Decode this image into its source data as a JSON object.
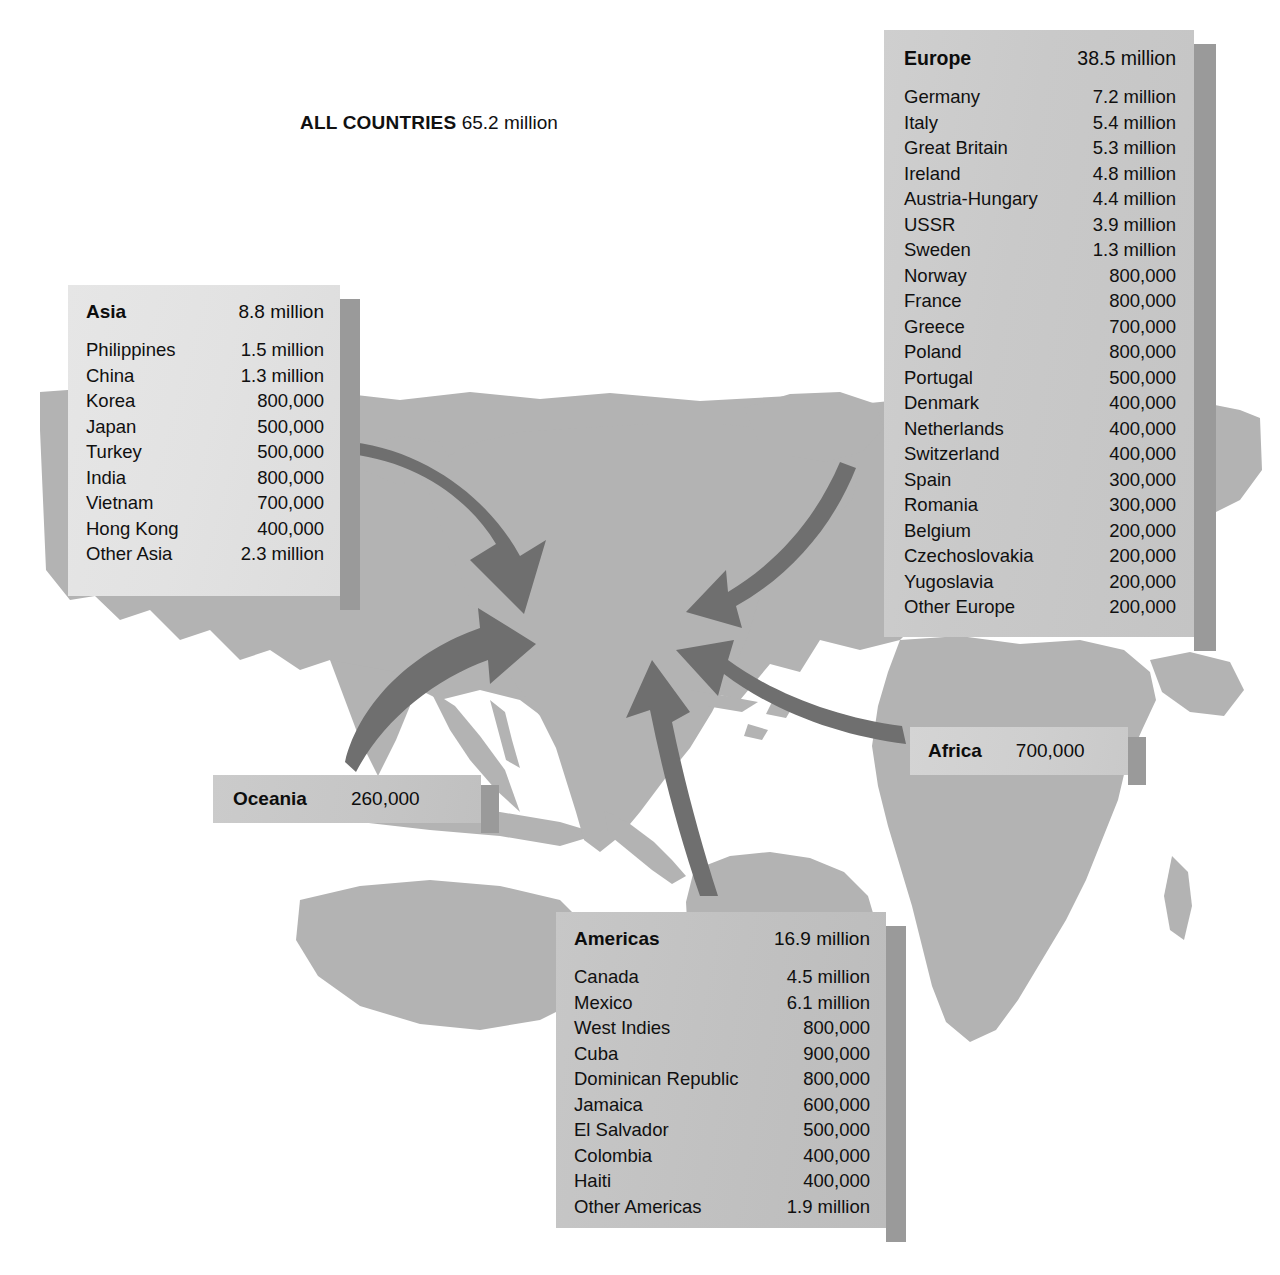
{
  "title": {
    "label": "ALL COUNTRIES",
    "value": "65.2 million"
  },
  "panels": {
    "europe": {
      "name": "Europe",
      "total": "38.5 million",
      "rows": [
        {
          "country": "Germany",
          "value": "7.2 million"
        },
        {
          "country": "Italy",
          "value": "5.4 million"
        },
        {
          "country": "Great Britain",
          "value": "5.3 million"
        },
        {
          "country": "Ireland",
          "value": "4.8 million"
        },
        {
          "country": "Austria-Hungary",
          "value": "4.4 million"
        },
        {
          "country": "USSR",
          "value": "3.9 million"
        },
        {
          "country": "Sweden",
          "value": "1.3 million"
        },
        {
          "country": "Norway",
          "value": "800,000"
        },
        {
          "country": "France",
          "value": "800,000"
        },
        {
          "country": "Greece",
          "value": "700,000"
        },
        {
          "country": "Poland",
          "value": "800,000"
        },
        {
          "country": "Portugal",
          "value": "500,000"
        },
        {
          "country": "Denmark",
          "value": "400,000"
        },
        {
          "country": "Netherlands",
          "value": "400,000"
        },
        {
          "country": "Switzerland",
          "value": "400,000"
        },
        {
          "country": "Spain",
          "value": "300,000"
        },
        {
          "country": "Romania",
          "value": "300,000"
        },
        {
          "country": "Belgium",
          "value": "200,000"
        },
        {
          "country": "Czechoslovakia",
          "value": "200,000"
        },
        {
          "country": "Yugoslavia",
          "value": "200,000"
        },
        {
          "country": "Other Europe",
          "value": "200,000"
        }
      ]
    },
    "asia": {
      "name": "Asia",
      "total": "8.8 million",
      "rows": [
        {
          "country": "Philippines",
          "value": "1.5 million"
        },
        {
          "country": "China",
          "value": "1.3 million"
        },
        {
          "country": "Korea",
          "value": "800,000"
        },
        {
          "country": "Japan",
          "value": "500,000"
        },
        {
          "country": "Turkey",
          "value": "500,000"
        },
        {
          "country": "India",
          "value": "800,000"
        },
        {
          "country": "Vietnam",
          "value": "700,000"
        },
        {
          "country": "Hong Kong",
          "value": "400,000"
        },
        {
          "country": "Other Asia",
          "value": "2.3 million"
        }
      ]
    },
    "americas": {
      "name": "Americas",
      "total": "16.9 million",
      "rows": [
        {
          "country": "Canada",
          "value": "4.5 million"
        },
        {
          "country": "Mexico",
          "value": "6.1 million"
        },
        {
          "country": "West Indies",
          "value": "800,000"
        },
        {
          "country": "Cuba",
          "value": "900,000"
        },
        {
          "country": "Dominican Republic",
          "value": "800,000"
        },
        {
          "country": "Jamaica",
          "value": "600,000"
        },
        {
          "country": "El Salvador",
          "value": "500,000"
        },
        {
          "country": "Colombia",
          "value": "400,000"
        },
        {
          "country": "Haiti",
          "value": "400,000"
        },
        {
          "country": "Other Americas",
          "value": "1.9 million"
        }
      ]
    },
    "oceania": {
      "name": "Oceania",
      "total": "260,000",
      "rows": []
    },
    "africa": {
      "name": "Africa",
      "total": "700,000",
      "rows": []
    }
  },
  "colors": {
    "land": "#b3b3b3",
    "arrow": "#6f6f6f",
    "panel_light": "#e2e2e2",
    "panel_mid": "#cbcbcb",
    "panel_dark": "#c1c1c1",
    "shadow": "#9a9a9a",
    "background": "#ffffff",
    "text": "#101010"
  },
  "chart_data": {
    "type": "table",
    "title": "ALL COUNTRIES 65.2 million",
    "regions": [
      {
        "name": "Europe",
        "total_text": "38.5 million",
        "total_millions": 38.5
      },
      {
        "name": "Americas",
        "total_text": "16.9 million",
        "total_millions": 16.9
      },
      {
        "name": "Asia",
        "total_text": "8.8 million",
        "total_millions": 8.8
      },
      {
        "name": "Africa",
        "total_text": "700,000",
        "total_millions": 0.7
      },
      {
        "name": "Oceania",
        "total_text": "260,000",
        "total_millions": 0.26
      }
    ],
    "grand_total_text": "65.2 million",
    "grand_total_millions": 65.2,
    "arrows": [
      {
        "from": "Asia",
        "to": "North America"
      },
      {
        "from": "Oceania",
        "to": "North America"
      },
      {
        "from": "Europe",
        "to": "North America"
      },
      {
        "from": "Africa",
        "to": "North America"
      },
      {
        "from": "Americas",
        "to": "North America"
      }
    ]
  }
}
